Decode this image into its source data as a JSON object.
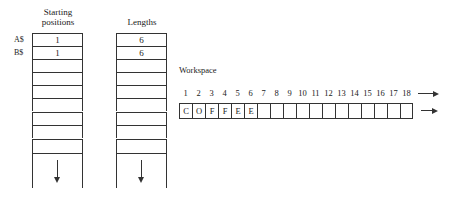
{
  "starting_positions": {
    "header_line1": "Starting",
    "header_line2": "positions",
    "row_labels": [
      "A$",
      "B$"
    ],
    "values": [
      "1",
      "1",
      "",
      "",
      "",
      "",
      "",
      "",
      "",
      ""
    ]
  },
  "lengths": {
    "header": "Lengths",
    "values": [
      "6",
      "6",
      "",
      "",
      "",
      "",
      "",
      "",
      "",
      ""
    ]
  },
  "workspace": {
    "label": "Workspace",
    "indices": [
      "1",
      "2",
      "3",
      "4",
      "5",
      "6",
      "7",
      "8",
      "9",
      "10",
      "11",
      "12",
      "13",
      "14",
      "15",
      "16",
      "17",
      "18"
    ],
    "cells": [
      "C",
      "O",
      "F",
      "F",
      "E",
      "E",
      "",
      "",
      "",
      "",
      "",
      "",
      "",
      "",
      "",
      "",
      "",
      ""
    ]
  },
  "icons": {
    "down-arrow": "continues-down-arrow",
    "right-arrow": "continues-right-arrow"
  }
}
